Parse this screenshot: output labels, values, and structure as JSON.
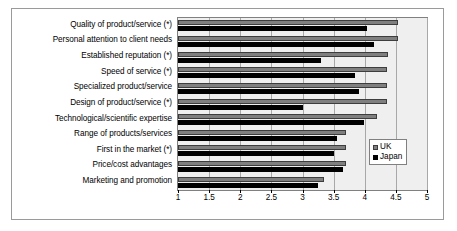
{
  "chart_data": {
    "type": "bar",
    "orientation": "horizontal",
    "title": "",
    "xlabel": "",
    "ylabel": "",
    "xlim": [
      1,
      5
    ],
    "xticks": [
      "1",
      "1.5",
      "2",
      "2.5",
      "3",
      "3.5",
      "4",
      "4.5",
      "5"
    ],
    "xtick_values": [
      1,
      1.5,
      2,
      2.5,
      3,
      3.5,
      4,
      4.5,
      5
    ],
    "grid": true,
    "legend_position": "right-inside",
    "categories": [
      "Quality of product/service (*)",
      "Personal attention to client needs",
      "Established reputation (*)",
      "Speed of service (*)",
      "Specialized product/service",
      "Design of product/service (*)",
      "Technological/scientific expertise",
      "Range of products/services",
      "First in the market (*)",
      "Price/cost advantages",
      "Marketing and promotion"
    ],
    "series": [
      {
        "name": "UK",
        "color": "#7f7f7f",
        "values": [
          4.53,
          4.53,
          4.38,
          4.35,
          4.35,
          4.35,
          4.2,
          3.7,
          3.7,
          3.7,
          3.35
        ]
      },
      {
        "name": "Japan",
        "color": "#000000",
        "values": [
          4.03,
          4.15,
          3.3,
          3.85,
          3.9,
          3.0,
          3.99,
          3.55,
          3.5,
          3.65,
          3.25
        ]
      }
    ]
  },
  "legend": {
    "items": [
      {
        "label": "UK"
      },
      {
        "label": "Japan"
      }
    ]
  }
}
